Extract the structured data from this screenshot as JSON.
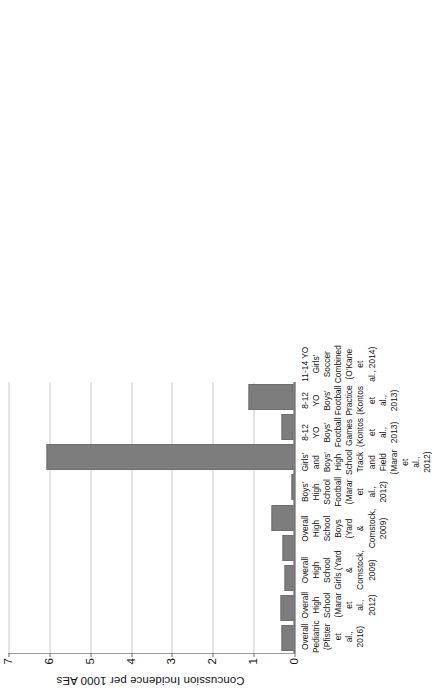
{
  "chart_data": {
    "type": "bar",
    "title": "",
    "xlabel": "",
    "ylabel": "Concussion Incidence per 1000 AEs",
    "ylim": [
      0,
      7
    ],
    "yticks": [
      0,
      1,
      2,
      3,
      4,
      5,
      6,
      7
    ],
    "grid": true,
    "legend": "none",
    "orientation": "vertical-bars-rotated-90ccw",
    "bar_color": "#7d7d7d",
    "categories": [
      "Overall Pediatric (Pfister et al., 2016)",
      "Overall High School (Marar et al., 2012)",
      "Overall High School Girls (Yard & Comstock, 2009)",
      "Overall High School Boys (Yard & Comstock, 2009)",
      "Boys' High School Football (Marar et al., 2012)",
      "Girls' and Boys' High School Track and Field (Marar et al., 2012)",
      "8-12 YO Boys' Football Games (Kontos et al., 2013)",
      "8-12 YO Boys' Football Practice (Kontos et al., 2013)",
      "11-14 YO Girls' Soccer Combined (O'Kane et al., 2014)"
    ],
    "values": [
      0.3,
      0.33,
      0.22,
      0.28,
      0.55,
      0.0,
      6.05,
      0.3,
      1.1
    ]
  },
  "axis": {
    "y_title": "Concussion Incidence per 1000 AEs",
    "tick_labels": [
      "7",
      "6",
      "5",
      "4",
      "3",
      "2",
      "1",
      "0"
    ]
  },
  "categories": [
    {
      "id": "overall-pediatric",
      "lines": [
        "Overall",
        "Pediatric",
        "(Pfister et",
        "al., 2016)"
      ],
      "value": 0.3
    },
    {
      "id": "overall-high-school",
      "lines": [
        "Overall",
        "High",
        "School",
        "(Marar et",
        "al., 2012)"
      ],
      "value": 0.33
    },
    {
      "id": "hs-girls",
      "lines": [
        "Overall",
        "High",
        "School",
        "Girls (Yard",
        "&",
        "Comstock,",
        "2009)"
      ],
      "value": 0.22
    },
    {
      "id": "hs-boys",
      "lines": [
        "Overall",
        "High",
        "School",
        "Boys (Yard",
        "&",
        "Comstock,",
        "2009)"
      ],
      "value": 0.28
    },
    {
      "id": "boys-hs-football",
      "lines": [
        "Boys' High",
        "School",
        "Football",
        "(Marar et",
        "al., 2012)"
      ],
      "value": 0.55
    },
    {
      "id": "track-and-field",
      "lines": [
        "Girls' and",
        "Boys' High",
        "School",
        "Track and",
        "Field",
        "(Marar et",
        "al., 2012)"
      ],
      "value": 0.0
    },
    {
      "id": "youth-football-games",
      "lines": [
        "8-12 YO",
        "Boys'",
        "Football",
        "Games",
        "(Kontos et",
        "al., 2013)"
      ],
      "value": 6.05
    },
    {
      "id": "youth-football-practice",
      "lines": [
        "8-12 YO",
        "Boys'",
        "Football",
        "Practice",
        "(Kontos et",
        "al., 2013)"
      ],
      "value": 0.3
    },
    {
      "id": "girls-soccer",
      "lines": [
        "11-14 YO",
        "Girls'",
        "Soccer",
        "Combined",
        "(O'Kane et",
        "al., 2014)"
      ],
      "value": 1.1
    }
  ]
}
